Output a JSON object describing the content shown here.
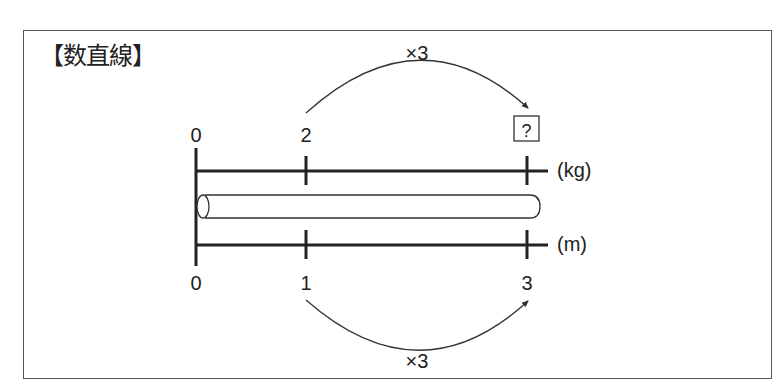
{
  "title": "【数直線】",
  "diagram": {
    "top_line": {
      "unit": "(kg)",
      "labels": [
        "0",
        "2",
        "?"
      ]
    },
    "bottom_line": {
      "unit": "(m)",
      "labels": [
        "0",
        "1",
        "3"
      ]
    },
    "top_arrow_label": "×3",
    "bottom_arrow_label": "×3",
    "unknown_box": "?"
  }
}
